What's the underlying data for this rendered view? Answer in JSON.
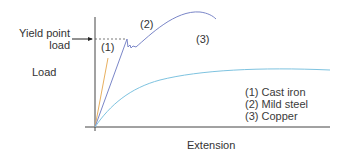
{
  "diagram": {
    "yield_label_line1": "Yield point",
    "yield_label_line2": "load",
    "y_axis_label": "Load",
    "x_axis_label": "Extension",
    "curve_labels": {
      "c1": "(1)",
      "c2": "(2)",
      "c3": "(3)"
    },
    "legend": [
      {
        "label": "(1) Cast iron",
        "color": "#e8b060"
      },
      {
        "label": "(2) Mild steel",
        "color": "#7a86c8"
      },
      {
        "label": "(3) Copper",
        "color": "#7ec3e0"
      }
    ],
    "colors": {
      "axis": "#444444",
      "cast_iron": "#e8b060",
      "mild_steel": "#7a86c8",
      "copper": "#7ec3e0"
    }
  }
}
